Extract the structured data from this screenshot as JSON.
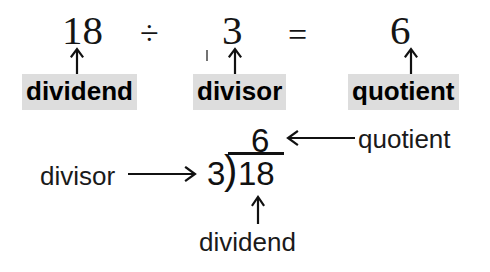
{
  "diagram": {
    "background_color": "#ffffff",
    "ink_color": "#111111",
    "highlight_color": "#dddddd"
  },
  "equation": {
    "dividend": "18",
    "divide_operator": "÷",
    "divisor": "3",
    "equals_operator": "=",
    "quotient": "6"
  },
  "labels": {
    "dividend": "dividend",
    "divisor": "divisor",
    "quotient": "quotient"
  },
  "long_division": {
    "quotient": "6",
    "divisor": "3",
    "dividend": "18",
    "bracket_glyph": ")",
    "callout_left": "divisor",
    "callout_right": "quotient",
    "callout_bottom": "dividend"
  },
  "icons": {
    "up_arrow": "arrow-up-icon",
    "left_arrow": "arrow-left-icon",
    "right_arrow": "arrow-right-icon"
  }
}
